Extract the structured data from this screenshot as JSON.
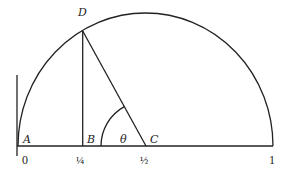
{
  "diagram": {
    "type": "semicircle-geometry",
    "points": {
      "A": {
        "label": "A"
      },
      "B": {
        "label": "B"
      },
      "C": {
        "label": "C"
      },
      "D": {
        "label": "D"
      }
    },
    "angle_label": "θ",
    "axis_ticks": [
      {
        "value": "0"
      },
      {
        "value": "¼"
      },
      {
        "value": "½"
      },
      {
        "value": "1"
      }
    ],
    "colors": {
      "line": "#222222",
      "background": "#ffffff"
    }
  }
}
